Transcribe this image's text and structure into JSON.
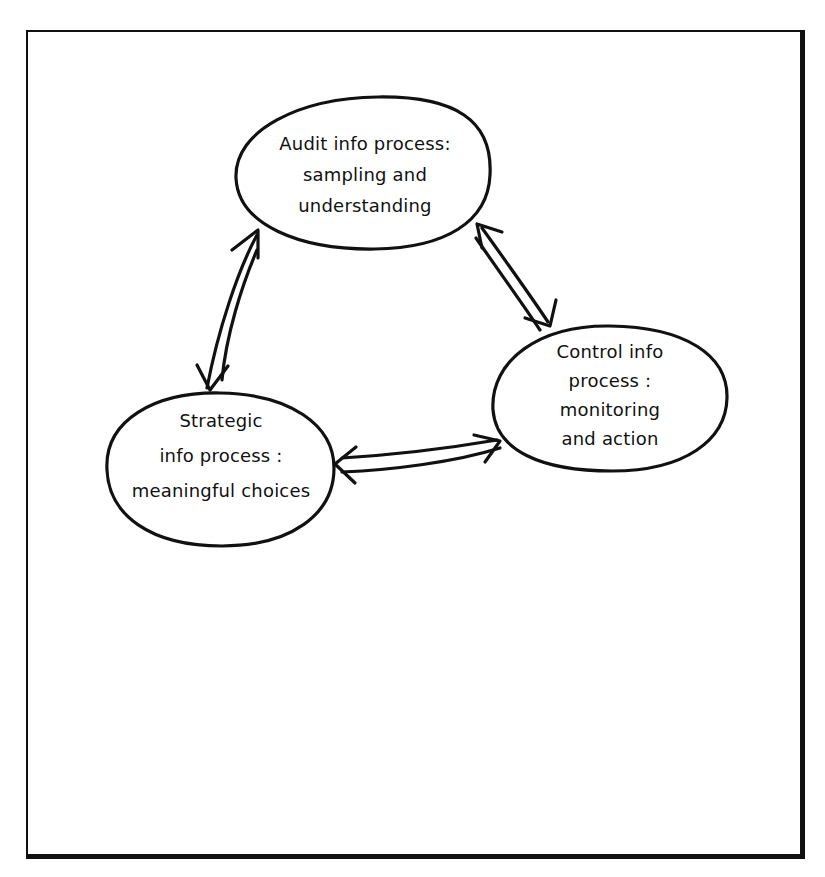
{
  "diagram": {
    "type": "cycle",
    "style": "hand-drawn",
    "colors": {
      "stroke": "#111111",
      "background": "#ffffff"
    },
    "nodes": [
      {
        "id": "audit",
        "lines": [
          "Audit info process:",
          "sampling and",
          "understanding"
        ]
      },
      {
        "id": "control",
        "lines": [
          "Control info",
          "process :",
          "monitoring",
          "and action"
        ]
      },
      {
        "id": "strategic",
        "lines": [
          "Strategic",
          "info process :",
          "meaningful choices"
        ]
      }
    ],
    "edges": [
      {
        "from": "audit",
        "to": "control",
        "direction": "bidirectional"
      },
      {
        "from": "control",
        "to": "strategic",
        "direction": "bidirectional"
      },
      {
        "from": "strategic",
        "to": "audit",
        "direction": "bidirectional"
      }
    ]
  }
}
